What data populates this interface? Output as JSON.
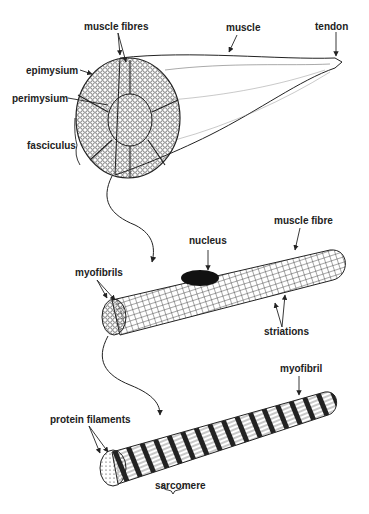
{
  "diagram": {
    "type": "anatomical-illustration",
    "panels": [
      {
        "name": "muscle",
        "labels": {
          "muscle_fibres": "muscle fibres",
          "muscle": "muscle",
          "tendon": "tendon",
          "epimysium": "epimysium",
          "perimysium": "perimysium",
          "fasciculus": "fasciculus"
        }
      },
      {
        "name": "muscle-fibre",
        "labels": {
          "nucleus": "nucleus",
          "muscle_fibre": "muscle fibre",
          "myofibrils": "myofibrils",
          "striations": "striations"
        }
      },
      {
        "name": "myofibril",
        "labels": {
          "myofibril": "myofibril",
          "protein_filaments": "protein filaments",
          "sarcomere": "sarcomere"
        }
      }
    ],
    "colors": {
      "ink": "#222222",
      "background": "#ffffff"
    }
  }
}
